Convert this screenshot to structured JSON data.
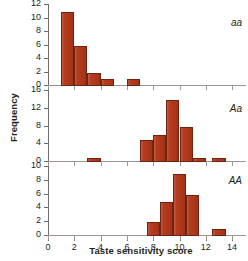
{
  "chart_data": {
    "type": "bar",
    "title": "",
    "xlabel": "Taste sensitivity score",
    "ylabel": "Frequency",
    "xlim": [
      0,
      14.6
    ],
    "xticks": [
      0,
      2,
      4,
      6,
      8,
      10,
      12,
      14
    ],
    "xticklabels": [
      "0",
      "2",
      "4",
      "6",
      "8",
      "10",
      "12",
      "14"
    ],
    "grid": false,
    "legend_position": "inside-right",
    "bar_color": "#b4381a",
    "bar_edge_color": "#6d2410",
    "axis_color": "#6f6a68",
    "panels": [
      {
        "name": "panel-aa",
        "annotation": "aa",
        "ylim": [
          0,
          12
        ],
        "yticks": [
          0,
          2,
          4,
          6,
          8,
          10,
          12
        ],
        "yticklabels": [
          "0",
          "2",
          "4",
          "6",
          "8",
          "10",
          "12"
        ],
        "bins": [
          {
            "x0": 1,
            "x1": 2,
            "value": 11
          },
          {
            "x0": 2,
            "x1": 3,
            "value": 6
          },
          {
            "x0": 3,
            "x1": 4,
            "value": 2
          },
          {
            "x0": 4,
            "x1": 5,
            "value": 1
          },
          {
            "x0": 6,
            "x1": 7,
            "value": 1
          }
        ]
      },
      {
        "name": "panel-Aa",
        "annotation": "Aa",
        "ylim": [
          0,
          16
        ],
        "yticks": [
          0,
          4,
          8,
          12,
          16
        ],
        "yticklabels": [
          "0",
          "4",
          "8",
          "12",
          "16"
        ],
        "bins": [
          {
            "x0": 3,
            "x1": 4,
            "value": 1
          },
          {
            "x0": 7,
            "x1": 8,
            "value": 5
          },
          {
            "x0": 8,
            "x1": 9,
            "value": 6
          },
          {
            "x0": 9,
            "x1": 10,
            "value": 14
          },
          {
            "x0": 10,
            "x1": 11,
            "value": 8
          },
          {
            "x0": 11,
            "x1": 12,
            "value": 1
          },
          {
            "x0": 12.5,
            "x1": 13.5,
            "value": 1
          }
        ]
      },
      {
        "name": "panel-AA",
        "annotation": "AA",
        "ylim": [
          0,
          10
        ],
        "yticks": [
          0,
          2,
          4,
          6,
          8,
          10
        ],
        "yticklabels": [
          "0",
          "2",
          "4",
          "6",
          "8",
          "10"
        ],
        "bins": [
          {
            "x0": 7.5,
            "x1": 8.5,
            "value": 2
          },
          {
            "x0": 8.5,
            "x1": 9.5,
            "value": 5
          },
          {
            "x0": 9.5,
            "x1": 10.5,
            "value": 9
          },
          {
            "x0": 10.5,
            "x1": 11.5,
            "value": 6
          },
          {
            "x0": 12.5,
            "x1": 13.5,
            "value": 1
          }
        ]
      }
    ]
  }
}
